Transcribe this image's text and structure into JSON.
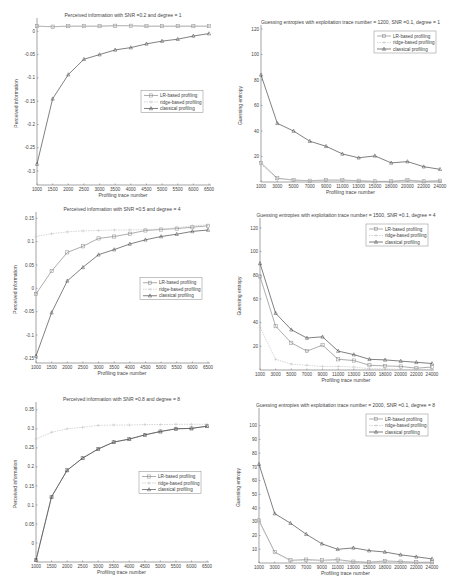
{
  "legend": [
    "LR-based profiling",
    "ridge-based profiling",
    "classical profiling"
  ],
  "series_colors": {
    "LR-based profiling": "#8a8a8a",
    "ridge-based profiling": "#c4c4c4",
    "classical profiling": "#4a4a4a"
  },
  "chart_data": [
    {
      "id": "pi_snr02_deg1",
      "type": "line",
      "title": "Perceived information with SNR =0.2 and degree = 1",
      "xlabel": "Profiling trace number",
      "ylabel": "Perceived information",
      "x": [
        1000,
        1500,
        2000,
        2500,
        3000,
        3500,
        4000,
        4500,
        5000,
        5500,
        6000,
        6500
      ],
      "xticks": [
        "1000",
        "1500",
        "2000",
        "2500",
        "3000",
        "3500",
        "4000",
        "4500",
        "5000",
        "5500",
        "6000",
        "6500"
      ],
      "yticks": [
        "0",
        "-0.05",
        "-0.1",
        "-0.15",
        "-0.2",
        "-0.25",
        "-0.3"
      ],
      "ylim": [
        -0.33,
        0.02
      ],
      "grid": false,
      "legend_position": "center-right",
      "series": [
        {
          "name": "LR-based profiling",
          "values": [
            0.011,
            0.01,
            0.011,
            0.011,
            0.011,
            0.012,
            0.012,
            0.011,
            0.011,
            0.011,
            0.011,
            0.011
          ]
        },
        {
          "name": "ridge-based profiling",
          "values": [
            0.011,
            0.01,
            0.011,
            0.011,
            0.011,
            0.012,
            0.012,
            0.011,
            0.011,
            0.011,
            0.011,
            0.011
          ]
        },
        {
          "name": "classical profiling",
          "values": [
            -0.285,
            -0.145,
            -0.093,
            -0.06,
            -0.05,
            -0.04,
            -0.035,
            -0.027,
            -0.021,
            -0.017,
            -0.01,
            -0.005
          ]
        }
      ]
    },
    {
      "id": "ge_1200_snr01_deg1",
      "type": "line",
      "title": "Guessing entropies with exploitation trace number = 1200, SNR =0.1, degree = 1",
      "xlabel": "Profiling trace number",
      "ylabel": "Guessing entropy",
      "x": [
        1000,
        3000,
        5000,
        7000,
        9000,
        11000,
        13000,
        15000,
        18000,
        20000,
        22000,
        24000
      ],
      "xticks": [
        "1000",
        "3000",
        "5000",
        "7000",
        "9000",
        "11000",
        "13000",
        "15000",
        "18000",
        "20000",
        "22000",
        "24000"
      ],
      "yticks": [
        "20",
        "40",
        "60",
        "80",
        "100",
        "120"
      ],
      "ylim": [
        0,
        120
      ],
      "grid": false,
      "legend_position": "top-right",
      "series": [
        {
          "name": "LR-based profiling",
          "values": [
            15,
            3,
            1.5,
            1,
            1.5,
            1.5,
            1,
            0.5,
            0.5,
            1.5,
            0.5,
            1
          ]
        },
        {
          "name": "ridge-based profiling",
          "values": [
            14,
            2.5,
            1.5,
            1,
            1.5,
            1.5,
            1,
            0.5,
            0.5,
            1.5,
            0.5,
            1
          ]
        },
        {
          "name": "classical profiling",
          "values": [
            84,
            46,
            40,
            32,
            28,
            22,
            19,
            20.5,
            15,
            16,
            12,
            10
          ]
        }
      ]
    },
    {
      "id": "pi_snr05_deg4",
      "type": "line",
      "title": "Perceived information with SNR =0.5 and degree = 4",
      "xlabel": "Profiling trace number",
      "ylabel": "Perceived information",
      "x": [
        1000,
        1500,
        2000,
        2500,
        3000,
        3500,
        4000,
        4500,
        5000,
        5500,
        6000,
        6500
      ],
      "xticks": [
        "1000",
        "1500",
        "2000",
        "2500",
        "3000",
        "3500",
        "4000",
        "4500",
        "5000",
        "5500",
        "6000",
        "6500"
      ],
      "yticks": [
        "0.15",
        "0.1",
        "0.05",
        "0",
        "-0.05",
        "-0.1",
        "-0.15"
      ],
      "ylim": [
        -0.16,
        0.155
      ],
      "grid": false,
      "legend_position": "center-right",
      "series": [
        {
          "name": "LR-based profiling",
          "values": [
            -0.012,
            0.037,
            0.077,
            0.09,
            0.107,
            0.111,
            0.117,
            0.124,
            0.126,
            0.128,
            0.131,
            0.134
          ]
        },
        {
          "name": "ridge-based profiling",
          "values": [
            0.111,
            0.117,
            0.121,
            0.123,
            0.124,
            0.125,
            0.125,
            0.126,
            0.127,
            0.13,
            0.134,
            0.136
          ]
        },
        {
          "name": "classical profiling",
          "values": [
            -0.145,
            -0.052,
            0.016,
            0.045,
            0.072,
            0.083,
            0.095,
            0.104,
            0.111,
            0.116,
            0.122,
            0.125
          ]
        }
      ]
    },
    {
      "id": "ge_1500_snr01_deg4",
      "type": "line",
      "title": "Guessing entropies with exploitation trace number = 1500, SNR =0.1, degree = 4",
      "xlabel": "Profiling trace number",
      "ylabel": "Guessing entropy",
      "x": [
        1000,
        3000,
        5000,
        7000,
        9000,
        11000,
        13000,
        15000,
        18000,
        20000,
        22000,
        24000
      ],
      "xticks": [
        "1000",
        "3000",
        "5000",
        "7000",
        "9000",
        "11000",
        "13000",
        "15000",
        "18000",
        "20000",
        "22000",
        "24000"
      ],
      "yticks": [
        "20",
        "40",
        "60",
        "80",
        "100",
        "120"
      ],
      "ylim": [
        0,
        125
      ],
      "grid": false,
      "legend_position": "top-right",
      "series": [
        {
          "name": "LR-based profiling",
          "values": [
            79,
            37,
            23,
            16,
            21,
            9,
            8,
            4,
            3.5,
            3,
            1.5,
            2.5
          ]
        },
        {
          "name": "ridge-based profiling",
          "values": [
            36,
            9,
            5,
            4,
            3,
            3,
            2.5,
            1,
            1,
            0.5,
            0.5,
            0.5
          ]
        },
        {
          "name": "classical profiling",
          "values": [
            90,
            48,
            34,
            27,
            28,
            16,
            13,
            9,
            8.5,
            7.5,
            6.5,
            5.5
          ]
        }
      ]
    },
    {
      "id": "pi_snr08_deg8",
      "type": "line",
      "title": "Perceived information with SNR =0.8 and degree = 8",
      "xlabel": "Profiling trace number",
      "ylabel": "Perceived information",
      "x": [
        1000,
        1500,
        2000,
        2500,
        3000,
        3500,
        4000,
        4500,
        5000,
        5500,
        6000,
        6500
      ],
      "xticks": [
        "1000",
        "1500",
        "2000",
        "2500",
        "3000",
        "3500",
        "4000",
        "4500",
        "5000",
        "5500",
        "6000",
        "6500"
      ],
      "yticks": [
        "0.35",
        "0.3",
        "0.25",
        "0.2",
        "0.15",
        "0.1",
        "0.05",
        "0"
      ],
      "ylim": [
        -0.05,
        0.36
      ],
      "grid": false,
      "legend_position": "center-right",
      "series": [
        {
          "name": "LR-based profiling",
          "values": [
            -0.045,
            0.121,
            0.191,
            0.223,
            0.247,
            0.265,
            0.273,
            0.284,
            0.293,
            0.3,
            0.301,
            0.307
          ]
        },
        {
          "name": "ridge-based profiling",
          "values": [
            0.273,
            0.291,
            0.3,
            0.304,
            0.309,
            0.31,
            0.31,
            0.311,
            0.311,
            0.312,
            0.312,
            0.312
          ]
        },
        {
          "name": "classical profiling",
          "values": [
            -0.045,
            0.121,
            0.191,
            0.223,
            0.247,
            0.265,
            0.273,
            0.284,
            0.293,
            0.3,
            0.301,
            0.307
          ]
        }
      ]
    },
    {
      "id": "ge_2000_snr01_deg8",
      "type": "line",
      "title": "Guessing entropies with exploitation trace number = 2000, SNR =0.1, degree = 8",
      "xlabel": "Profiling trace number",
      "ylabel": "Guessing entropy",
      "x": [
        1000,
        3000,
        5000,
        7000,
        9000,
        11000,
        13000,
        15000,
        18000,
        20000,
        22000,
        24000
      ],
      "xticks": [
        "1000",
        "3000",
        "5000",
        "7000",
        "9000",
        "11000",
        "13000",
        "15000",
        "18000",
        "20000",
        "22000",
        "24000"
      ],
      "yticks": [
        "10",
        "20",
        "30",
        "40",
        "50",
        "60",
        "70",
        "80",
        "90",
        "100"
      ],
      "ylim": [
        0,
        110
      ],
      "grid": false,
      "legend_position": "top-right",
      "series": [
        {
          "name": "LR-based profiling",
          "values": [
            31,
            8,
            2,
            2.5,
            2,
            2.5,
            1,
            0.5,
            1.5,
            1,
            0.5,
            0.5
          ]
        },
        {
          "name": "ridge-based profiling",
          "values": [
            30,
            7.5,
            1.5,
            2,
            1.5,
            2,
            0.5,
            0.5,
            1,
            0.5,
            0.5,
            0.5
          ]
        },
        {
          "name": "classical profiling",
          "values": [
            72,
            36,
            29,
            21,
            14,
            10,
            11,
            9,
            8,
            6,
            4.5,
            3
          ]
        }
      ]
    }
  ]
}
